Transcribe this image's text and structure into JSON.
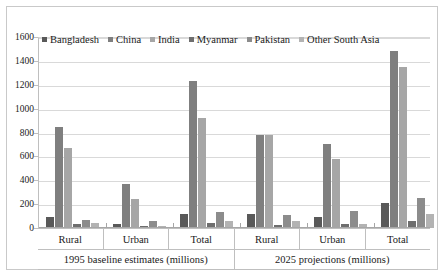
{
  "chart_data": {
    "type": "bar",
    "title": "",
    "subtitle": "",
    "xlabel": "",
    "ylabel": "",
    "ylim": [
      0,
      1600
    ],
    "ytick_step": 200,
    "yticks": [
      1600,
      1400,
      1200,
      1000,
      800,
      600,
      400,
      200,
      0
    ],
    "grid": true,
    "legend_position": "top-left",
    "categories": [
      "Rural",
      "Urban",
      "Total",
      "Rural",
      "Urban",
      "Total"
    ],
    "group_labels": [
      "1995 baseline estimates (millions)",
      "2025 projections (millions)"
    ],
    "group_spans": [
      3,
      3
    ],
    "series": [
      {
        "name": "Bangladesh",
        "color": "#595959",
        "values": [
          90,
          30,
          120,
          120,
          90,
          210
        ]
      },
      {
        "name": "China",
        "color": "#7f7f7f",
        "values": [
          850,
          370,
          1230,
          780,
          700,
          1480
        ]
      },
      {
        "name": "India",
        "color": "#a6a6a6",
        "values": [
          670,
          240,
          920,
          780,
          580,
          1350
        ]
      },
      {
        "name": "Myanmar",
        "color": "#6e6e6e",
        "values": [
          30,
          15,
          45,
          25,
          30,
          60
        ]
      },
      {
        "name": "Pakistan",
        "color": "#8c8c8c",
        "values": [
          70,
          60,
          130,
          110,
          140,
          250
        ]
      },
      {
        "name": "Other South Asia",
        "color": "#b3b3b3",
        "values": [
          40,
          20,
          60,
          60,
          30,
          120
        ]
      }
    ]
  },
  "legend": {
    "items": [
      {
        "label": "Bangladesh",
        "color": "#595959"
      },
      {
        "label": "China",
        "color": "#7f7f7f"
      },
      {
        "label": "India",
        "color": "#a6a6a6"
      },
      {
        "label": "Myanmar",
        "color": "#6e6e6e"
      },
      {
        "label": "Pakistan",
        "color": "#8c8c8c"
      },
      {
        "label": "Other South Asia",
        "color": "#b3b3b3"
      }
    ]
  },
  "axes": {
    "y_labels": [
      "1600",
      "1400",
      "1200",
      "1000",
      "800",
      "600",
      "400",
      "200",
      "0"
    ],
    "category_labels": [
      "Rural",
      "Urban",
      "Total",
      "Rural",
      "Urban",
      "Total"
    ],
    "group_labels": [
      "1995 baseline estimates (millions)",
      "2025 projections (millions)"
    ]
  },
  "colors": {
    "gridline": "#d9d9d9",
    "axis": "#bfbfbf",
    "frame": "#c9c9c9",
    "text": "#1a1a1a",
    "background": "#ffffff"
  }
}
